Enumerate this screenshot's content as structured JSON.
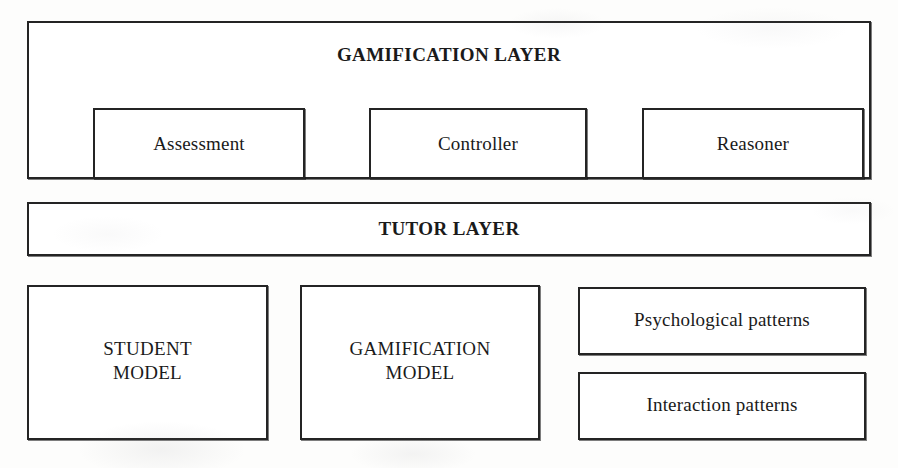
{
  "diagram": {
    "type": "layered-architecture",
    "layers": [
      {
        "id": "gamification-layer",
        "title": "GAMIFICATION LAYER",
        "components": [
          {
            "id": "assessment",
            "label": "Assessment"
          },
          {
            "id": "controller",
            "label": "Controller"
          },
          {
            "id": "reasoner",
            "label": "Reasoner"
          }
        ]
      },
      {
        "id": "tutor-layer",
        "title": "TUTOR LAYER",
        "components": []
      },
      {
        "id": "model-layer",
        "title": "",
        "components": [
          {
            "id": "student-model",
            "label": "STUDENT\nMODEL"
          },
          {
            "id": "gamification-model",
            "label": "GAMIFICATION\nMODEL"
          },
          {
            "id": "psychological-patterns",
            "label": "Psychological patterns"
          },
          {
            "id": "interaction-patterns",
            "label": "Interaction patterns"
          }
        ]
      }
    ]
  },
  "colors": {
    "page_background": "#fdfdfc",
    "box_fill": "#ffffff",
    "box_border": "#242424",
    "text": "#1a1a1a"
  }
}
